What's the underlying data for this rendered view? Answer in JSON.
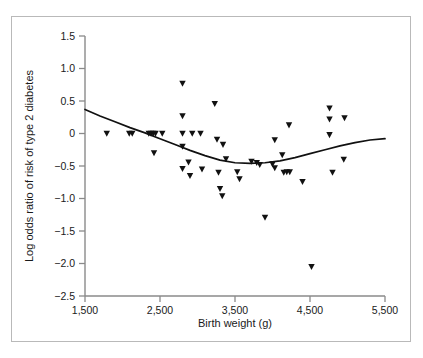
{
  "chart_data": {
    "type": "scatter",
    "title": "",
    "subtitle": "",
    "xlabel": "Birth weight (g)",
    "ylabel": "Log odds ratio of risk of type 2 diabetes",
    "xlim": [
      1500,
      5500
    ],
    "ylim": [
      -2.5,
      1.5
    ],
    "xticks": [
      1500,
      2500,
      3500,
      4500,
      5500
    ],
    "xtick_labels": [
      "1,500",
      "2,500",
      "3,500",
      "4,500",
      "5,500"
    ],
    "yticks": [
      1.5,
      1.0,
      0.5,
      0,
      -0.5,
      -1.0,
      -1.5,
      -2.0,
      -2.5
    ],
    "ytick_labels": [
      "1.5",
      "1.0",
      "0.5",
      "0",
      "−0.5",
      "−1.0",
      "−1.5",
      "−2.0",
      "−2.5"
    ],
    "grid": false,
    "legend": null,
    "marker_shape": "triangle-down",
    "marker_color": "#111111",
    "series": [
      {
        "name": "Study log odds ratios",
        "marker": "triangle-down",
        "points": [
          [
            1790,
            0.0
          ],
          [
            2090,
            0.0
          ],
          [
            2130,
            0.0
          ],
          [
            2350,
            0.0
          ],
          [
            2380,
            0.0
          ],
          [
            2410,
            0.0
          ],
          [
            2440,
            0.0
          ],
          [
            2530,
            0.0
          ],
          [
            2420,
            -0.3
          ],
          [
            2800,
            0.77
          ],
          [
            2800,
            0.27
          ],
          [
            2800,
            0.0
          ],
          [
            2800,
            -0.2
          ],
          [
            2800,
            -0.54
          ],
          [
            2930,
            0.0
          ],
          [
            2880,
            -0.44
          ],
          [
            2900,
            -0.65
          ],
          [
            3040,
            0.0
          ],
          [
            3060,
            -0.55
          ],
          [
            3230,
            0.46
          ],
          [
            3260,
            -0.09
          ],
          [
            3280,
            -0.6
          ],
          [
            3340,
            -0.17
          ],
          [
            3300,
            -0.85
          ],
          [
            3330,
            -0.96
          ],
          [
            3380,
            -0.39
          ],
          [
            3530,
            -0.59
          ],
          [
            3560,
            -0.7
          ],
          [
            3720,
            -0.43
          ],
          [
            3790,
            -0.45
          ],
          [
            3830,
            -0.48
          ],
          [
            3900,
            -1.29
          ],
          [
            4000,
            -0.47
          ],
          [
            4030,
            -0.53
          ],
          [
            4030,
            -0.1
          ],
          [
            4130,
            -0.33
          ],
          [
            4150,
            -0.6
          ],
          [
            4190,
            -0.59
          ],
          [
            4230,
            -0.59
          ],
          [
            4220,
            0.13
          ],
          [
            4400,
            -0.74
          ],
          [
            4520,
            -2.05
          ],
          [
            4760,
            0.39
          ],
          [
            4760,
            0.22
          ],
          [
            4760,
            -0.02
          ],
          [
            4800,
            -0.6
          ],
          [
            4960,
            0.24
          ],
          [
            4950,
            -0.4
          ]
        ]
      }
    ],
    "fit_curve": {
      "name": "Fitted quadratic spline",
      "style": "solid",
      "color": "#111111",
      "points": [
        [
          1500,
          0.37
        ],
        [
          1700,
          0.27
        ],
        [
          1900,
          0.18
        ],
        [
          2100,
          0.09
        ],
        [
          2300,
          0.01
        ],
        [
          2500,
          -0.08
        ],
        [
          2700,
          -0.17
        ],
        [
          2900,
          -0.26
        ],
        [
          3100,
          -0.34
        ],
        [
          3300,
          -0.41
        ],
        [
          3500,
          -0.45
        ],
        [
          3700,
          -0.46
        ],
        [
          3900,
          -0.45
        ],
        [
          4100,
          -0.42
        ],
        [
          4300,
          -0.37
        ],
        [
          4500,
          -0.31
        ],
        [
          4700,
          -0.25
        ],
        [
          4900,
          -0.19
        ],
        [
          5100,
          -0.14
        ],
        [
          5300,
          -0.1
        ],
        [
          5500,
          -0.08
        ]
      ]
    }
  },
  "figure": {
    "frame_color": "#b9b9b9",
    "background": "#ffffff",
    "axis_color": "#8a8a8a"
  }
}
